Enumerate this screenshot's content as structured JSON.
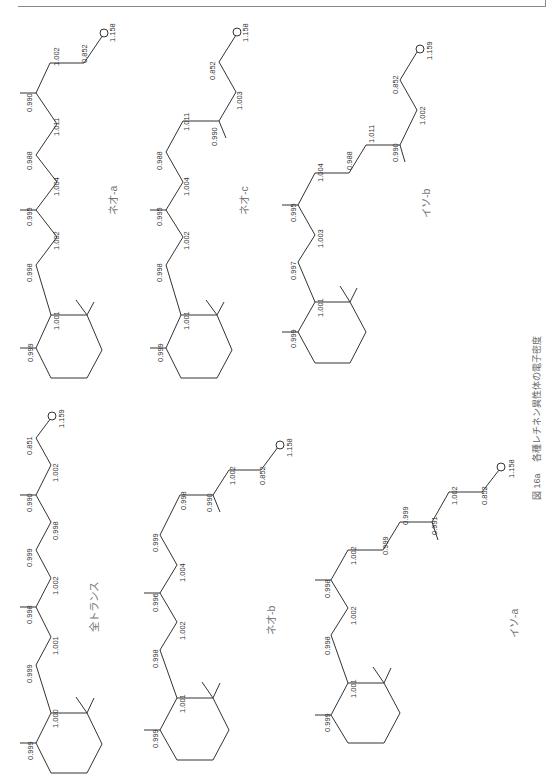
{
  "page": {
    "header_text": "",
    "figure_number": "図 16a",
    "caption": "各種レチネン異性体の電子密度"
  },
  "molecules": [
    {
      "name": "ネオ-a",
      "values": [
        "0.999",
        "1.001",
        "0.998",
        "1.002",
        "0.995",
        "1.004",
        "0.988",
        "1.011",
        "0.990",
        "1.002",
        "0.852",
        "1.158"
      ]
    },
    {
      "name": "ネオ-c",
      "values": [
        "0.999",
        "1.001",
        "0.998",
        "1.002",
        "0.995",
        "1.004",
        "0.988",
        "1.011",
        "0.990",
        "1.003",
        "0.852",
        "1.158"
      ]
    },
    {
      "name": "イソ-b",
      "values": [
        "0.999",
        "1.001",
        "0.997",
        "1.003",
        "0.995",
        "1.004",
        "0.988",
        "1.011",
        "0.990",
        "1.002",
        "0.852",
        "1.159"
      ]
    },
    {
      "name": "全トランス",
      "values": [
        "0.999",
        "1.000",
        "0.999",
        "1.001",
        "0.998",
        "1.002",
        "0.999",
        "0.998",
        "0.990",
        "1.002",
        "0.851",
        "1.159"
      ]
    },
    {
      "name": "ネオ-b",
      "values": [
        "0.999",
        "1.001",
        "0.998",
        "1.002",
        "0.996",
        "1.004",
        "0.999",
        "0.998",
        "0.990",
        "1.002",
        "0.852",
        "1.158"
      ]
    },
    {
      "name": "イソ-a",
      "values": [
        "0.999",
        "1.001",
        "0.998",
        "1.002",
        "0.998",
        "1.002",
        "0.999",
        "0.999",
        "0.991",
        "1.002",
        "0.852",
        "1.158"
      ]
    }
  ],
  "atom_symbols": {
    "oxygen": "O"
  }
}
